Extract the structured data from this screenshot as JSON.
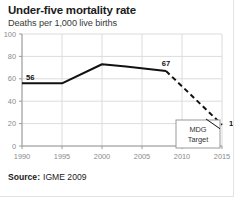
{
  "header": {
    "title": "Under-five mortality rate",
    "subtitle": "Deaths per 1,000 live births"
  },
  "source": {
    "label": "Source:",
    "value": "IGME 2009"
  },
  "annotations": {
    "mdg_line1": "MDG",
    "mdg_line2": "Target"
  },
  "colors": {
    "line": "#111111",
    "grid": "#dcdcdc",
    "axis": "#9a9a9a",
    "tick_text": "#8b8b8b",
    "title": "#1b1b1b",
    "box_border": "#9a9a9a",
    "background": "#ffffff"
  },
  "chart_data": {
    "type": "line",
    "title": "Under-five mortality rate",
    "subtitle": "Deaths per 1,000 live births",
    "xlabel": "",
    "ylabel": "Deaths per 1,000 live births",
    "xlim": [
      1990,
      2015
    ],
    "ylim": [
      0,
      100
    ],
    "xticks": [
      1990,
      1995,
      2000,
      2005,
      2010,
      2015
    ],
    "yticks": [
      0,
      20,
      40,
      60,
      80,
      100
    ],
    "xticklabels": [
      "1990",
      "1995",
      "2000",
      "2005",
      "2010",
      "2015"
    ],
    "yticklabels": [
      "0",
      "20",
      "40",
      "60",
      "80",
      "100"
    ],
    "grid": true,
    "legend": false,
    "series": [
      {
        "name": "Observed under-five mortality rate",
        "style": "solid",
        "x": [
          1990,
          1995,
          2000,
          2003,
          2008
        ],
        "values": [
          56,
          56,
          73,
          71,
          67
        ]
      },
      {
        "name": "Projection to MDG target",
        "style": "dashed",
        "x": [
          2008,
          2015
        ],
        "values": [
          67,
          19
        ]
      }
    ],
    "point_labels": [
      {
        "x": 1990,
        "value": 56,
        "text": "56"
      },
      {
        "x": 2008,
        "value": 67,
        "text": "67"
      },
      {
        "x": 2015,
        "value": 19,
        "text": "19"
      }
    ],
    "annotations": [
      {
        "text": "MDG Target",
        "x": 2014,
        "value": 10,
        "type": "box"
      }
    ]
  }
}
